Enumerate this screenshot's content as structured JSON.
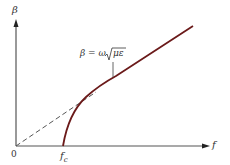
{
  "diagram": {
    "type": "dispersion-plot",
    "y_axis_label": "β",
    "x_axis_label": "f",
    "origin_label": "0",
    "cutoff_label": "f",
    "cutoff_subscript": "c",
    "formula": {
      "lhs": "β = ω",
      "sqrt_arg": "με"
    },
    "colors": {
      "axis": "#555555",
      "curve": "#6b1a1a",
      "dashed": "#555555",
      "text": "#333333"
    }
  }
}
